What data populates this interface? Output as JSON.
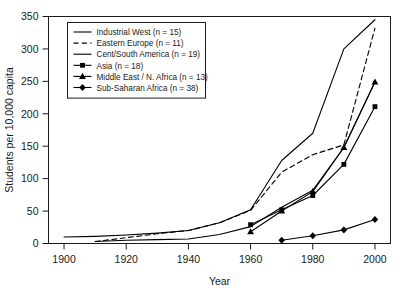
{
  "chart_data": {
    "type": "line",
    "title": "",
    "xlabel": "Year",
    "ylabel": "Students per 10,000 capita",
    "xlim": [
      1895,
      2005
    ],
    "ylim": [
      0,
      350
    ],
    "xticks": [
      1900,
      1920,
      1940,
      1960,
      1980,
      2000
    ],
    "xtick_labels": [
      "1900",
      "1920",
      "1940",
      "1960",
      "1980",
      "2000"
    ],
    "yticks": [
      0,
      50,
      100,
      150,
      200,
      250,
      300,
      350
    ],
    "ytick_labels": [
      "0",
      "50",
      "100",
      "150",
      "200",
      "250",
      "300",
      "350"
    ],
    "grid": false,
    "legend_position": "upper-left",
    "series": [
      {
        "name": "Industrial West (n = 15)",
        "label": "Industrial West",
        "n": 15,
        "style": "solid",
        "marker": "none",
        "x": [
          1900,
          1910,
          1920,
          1930,
          1940,
          1950,
          1960,
          1970,
          1980,
          1990,
          2000
        ],
        "y": [
          10,
          11,
          13,
          16,
          20,
          32,
          52,
          128,
          170,
          300,
          345
        ]
      },
      {
        "name": "Eastern Europe (n = 11)",
        "label": "Eastern Europe",
        "n": 11,
        "style": "dashed",
        "marker": "none",
        "x": [
          1910,
          1920,
          1930,
          1940,
          1950,
          1960,
          1970,
          1980,
          1990,
          2000
        ],
        "y": [
          3,
          9,
          15,
          20,
          32,
          51,
          110,
          137,
          152,
          332
        ]
      },
      {
        "name": "Cent/South America (n = 19)",
        "label": "Cent/South America",
        "n": 19,
        "style": "solid",
        "marker": "none",
        "x": [
          1910,
          1920,
          1930,
          1940,
          1950,
          1960,
          1970,
          1980,
          1990,
          2000
        ],
        "y": [
          3,
          5,
          6,
          7,
          14,
          26,
          56,
          82,
          148,
          249
        ]
      },
      {
        "name": "Asia (n = 18)",
        "label": "Asia",
        "n": 18,
        "style": "solid",
        "marker": "square",
        "x": [
          1960,
          1970,
          1980,
          1990,
          2000
        ],
        "y": [
          29,
          52,
          74,
          122,
          211
        ]
      },
      {
        "name": "Middle East / N. Africa (n = 13)",
        "label": "Middle East / N. Africa",
        "n": 13,
        "style": "solid",
        "marker": "triangle",
        "x": [
          1960,
          1970,
          1980,
          1990,
          2000
        ],
        "y": [
          18,
          50,
          80,
          148,
          249
        ]
      },
      {
        "name": "Sub-Saharan Africa (n = 38)",
        "label": "Sub–Saharan Africa",
        "n": 38,
        "style": "solid",
        "marker": "diamond",
        "x": [
          1970,
          1980,
          1990,
          2000
        ],
        "y": [
          5,
          12,
          21,
          37
        ]
      }
    ]
  },
  "colors": {
    "ink": "#1a1a1a",
    "line": "#000000",
    "background": "#ffffff"
  }
}
